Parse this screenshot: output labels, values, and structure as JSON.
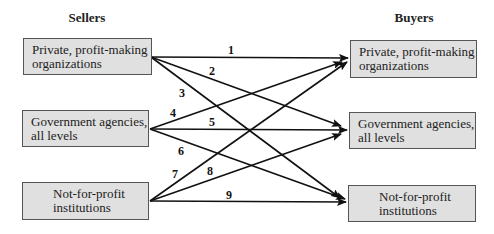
{
  "headers": {
    "sellers": "Sellers",
    "buyers": "Buyers"
  },
  "sellers": [
    {
      "line1": "Private, profit-making",
      "line2": "organizations"
    },
    {
      "line1": "Government agencies,",
      "line2": "all levels"
    },
    {
      "line1": "Not-for-profit",
      "line2": "institutions"
    }
  ],
  "buyers": [
    {
      "line1": "Private, profit-making",
      "line2": "organizations"
    },
    {
      "line1": "Government agencies,",
      "line2": "all levels"
    },
    {
      "line1": "Not-for-profit",
      "line2": "institutions"
    }
  ],
  "links": [
    {
      "id": "1",
      "from": "Private, profit-making organizations",
      "to": "Private, profit-making organizations"
    },
    {
      "id": "2",
      "from": "Private, profit-making organizations",
      "to": "Government agencies, all levels"
    },
    {
      "id": "3",
      "from": "Private, profit-making organizations",
      "to": "Not-for-profit institutions"
    },
    {
      "id": "4",
      "from": "Government agencies, all levels",
      "to": "Private, profit-making organizations"
    },
    {
      "id": "5",
      "from": "Government agencies, all levels",
      "to": "Government agencies, all levels"
    },
    {
      "id": "6",
      "from": "Government agencies, all levels",
      "to": "Not-for-profit institutions"
    },
    {
      "id": "7",
      "from": "Not-for-profit institutions",
      "to": "Private, profit-making organizations"
    },
    {
      "id": "8",
      "from": "Not-for-profit institutions",
      "to": "Government agencies, all levels"
    },
    {
      "id": "9",
      "from": "Not-for-profit institutions",
      "to": "Not-for-profit institutions"
    }
  ],
  "colors": {
    "box_fill": "#e0e0e0",
    "box_border": "#555555",
    "line": "#111111"
  }
}
